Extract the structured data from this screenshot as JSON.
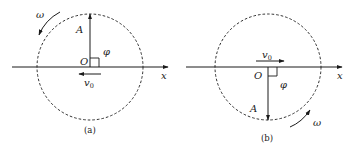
{
  "figures": [
    {
      "id": "a",
      "caption": "(a)",
      "labels": {
        "omega": "ω",
        "amplitude": "A",
        "origin": "O",
        "phase": "φ",
        "velocity": "v",
        "velocity_sub": "0",
        "axis": "x"
      },
      "amplitude_direction": "up",
      "velocity_direction": "left",
      "rotation": "counterclockwise"
    },
    {
      "id": "b",
      "caption": "(b)",
      "labels": {
        "omega": "ω",
        "amplitude": "A",
        "origin": "O",
        "phase": "φ",
        "velocity": "v",
        "velocity_sub": "0",
        "axis": "x"
      },
      "amplitude_direction": "down",
      "velocity_direction": "right",
      "rotation": "counterclockwise"
    }
  ],
  "colors": {
    "stroke": "#1a1a1a",
    "background": "#ffffff"
  }
}
